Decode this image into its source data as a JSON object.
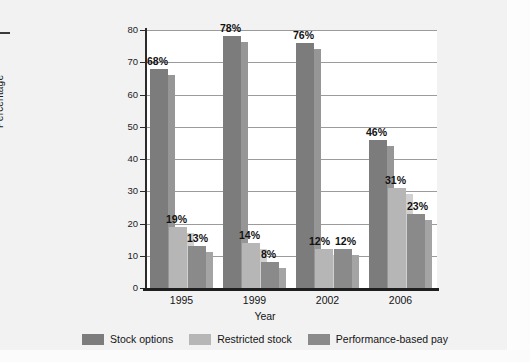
{
  "chart_data": {
    "type": "bar",
    "title": "",
    "xlabel": "Year",
    "ylabel": "Percentage",
    "categories": [
      "1995",
      "1999",
      "2002",
      "2006"
    ],
    "ylim": [
      0,
      80
    ],
    "yticks": [
      0,
      10,
      20,
      30,
      40,
      50,
      60,
      70,
      80
    ],
    "ytick_labels": [
      "0",
      "10",
      "20",
      "30",
      "40",
      "50",
      "60",
      "70",
      "80"
    ],
    "grid": true,
    "legend_position": "bottom",
    "value_label_suffix": "%",
    "series": [
      {
        "name": "Stock options",
        "color": "#7c7c7c",
        "values": [
          68,
          78,
          76,
          46
        ],
        "labels": [
          "68%",
          "78%",
          "76%",
          "46%"
        ]
      },
      {
        "name": "Restricted stock",
        "color": "#b6b6b6",
        "values": [
          19,
          14,
          12,
          31
        ],
        "labels": [
          "19%",
          "14%",
          "12%",
          "31%"
        ]
      },
      {
        "name": "Performance-based pay",
        "color": "#8a8a8a",
        "values": [
          13,
          8,
          12,
          23
        ],
        "labels": [
          "13%",
          "8%",
          "12%",
          "23%"
        ]
      }
    ]
  },
  "colors": {
    "page_background": "#f2f2f3",
    "plot_background": "#ffffff",
    "axis": "#2b2b2b",
    "gridline": "#9b9b9b",
    "series_1": "#7c7c7c",
    "series_2": "#b6b6b6",
    "series_3": "#8a8a8a",
    "label_text": "#111111"
  }
}
